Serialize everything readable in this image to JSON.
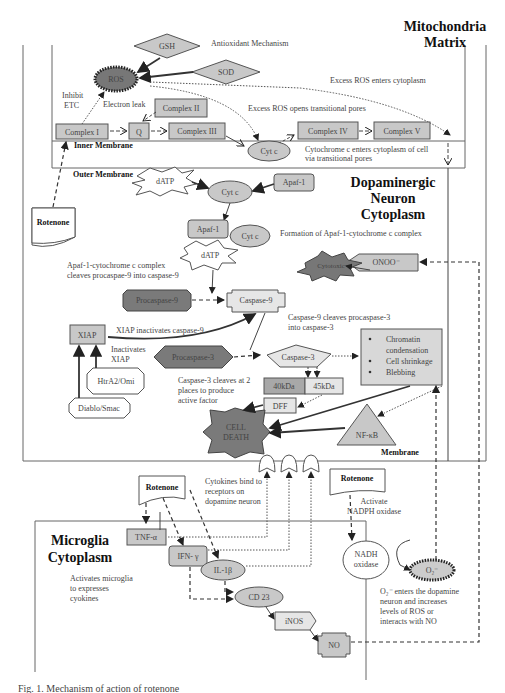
{
  "regions": {
    "mito": {
      "title_line1": "Mitochondria",
      "title_line2": "Matrix"
    },
    "neuron": {
      "title_line1": "Dopaminergic",
      "title_line2": "Neuron",
      "title_line3": "Cytoplasm"
    },
    "microglia": {
      "title_line1": "Microglia",
      "title_line2": "Cytoplasm"
    },
    "inner_membrane": "Inner Membrane",
    "outer_membrane": "Outer Membrane",
    "membrane": "Membrane"
  },
  "nodes": {
    "gsh": "GSH",
    "sod": "SOD",
    "ros": "ROS",
    "complex1": "Complex I",
    "q": "Q",
    "complex2": "Complex II",
    "complex3": "Complex III",
    "complex4": "Complex IV",
    "complex5": "Complex V",
    "cytc_mito": "Cyt c",
    "datp1": "dATP",
    "cytc1": "Cyt c",
    "apaf1_a": "Apaf-1",
    "apaf1_b": "Apaf-1",
    "cytc2": "Cyt c",
    "datp2": "dATP",
    "procaspase9": "Procaspase-9",
    "caspase9": "Caspase-9",
    "xiap": "XIAP",
    "htra2": "HtrA2/Omi",
    "diablo": "Diablo/Smac",
    "procaspase3": "Procaspase-3",
    "caspase3": "Caspase-3",
    "kda40": "40kDa",
    "kda45": "45kDa",
    "dff": "DFF",
    "cell_death_1": "CELL",
    "cell_death_2": "DEATH",
    "cytotoxic": "Cytotoxic",
    "onoo": "ONOO⁻",
    "nfkb": "NF-κB",
    "rotenone_1": "Rotenone",
    "rotenone_2": "Rotenone",
    "rotenone_3": "Rotenone",
    "tnfa": "TNF-α",
    "ifng": "IFN- γ",
    "il1b": "IL-1β",
    "cd23": "CD 23",
    "inos": "iNOS",
    "no": "NO",
    "nadh_1": "NADH",
    "nadh_2": "oxidase",
    "o2": "O₂⁻"
  },
  "effects": {
    "e1": "Chromatin",
    "e2": "condensation",
    "e3": "Cell shrinkage",
    "e4": "Blebbing"
  },
  "annotations": {
    "antioxidant": "Antioxidant Mechanism",
    "inhibit_1": "Inhibit",
    "inhibit_2": "ETC",
    "electron_leak": "Electron leak",
    "excess_ros_cyto": "Excess ROS enters cytoplasm",
    "excess_ros_pores": "Excess ROS opens transitional pores",
    "cytc_enters_1": "Cytochrome c enters cytoplasm of cell",
    "cytc_enters_2": "via transitional pores",
    "formation": "Formation of Apaf-1-cytochrome c complex",
    "apaf_cleave_1": "Apaf-1-cytochrome c complex",
    "apaf_cleave_2": "cleaves procaspae-9 into caspase-9",
    "xiap_inact": "XIAP inactivates caspase-9",
    "inact_xiap_1": "Inactivates",
    "inact_xiap_2": "XIAP",
    "casp9_cleave_1": "Caspase-9 cleaves procaspase-3",
    "casp9_cleave_2": "into caspase-3",
    "casp3_cleave_1": "Caspase-3 cleaves at 2",
    "casp3_cleave_2": "places to produce",
    "casp3_cleave_3": "active factor",
    "cytokines_1": "Cytokines bind to",
    "cytokines_2": "receptors on",
    "cytokines_3": "dopamine neuron",
    "activate_1": "Activate",
    "activate_2": "NADPH oxidase",
    "activates_mg_1": "Activates microglia",
    "activates_mg_2": "to expresses",
    "activates_mg_3": "cyokines",
    "o2_enters_1": "O₂⁻ enters the dopamine",
    "o2_enters_2": "neuron and increases",
    "o2_enters_3": "levels of ROS or",
    "o2_enters_4": "interacts with NO"
  },
  "caption": "Fig. 1. Mechanism of action of rotenone"
}
